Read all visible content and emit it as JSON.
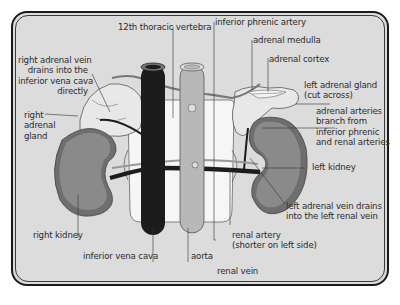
{
  "diagram": {
    "colors": {
      "background": "#dcdcdc",
      "frame": "#1a1a1a",
      "kidney": "#8a8a8a",
      "kidney_outer": "#6e6e6e",
      "inferior_vena_cava": "#1c1c1c",
      "aorta": "#b8b8b8",
      "adrenal_gland": "#e8e8e8",
      "vertebra": "#f6f6f6",
      "label_text": "#2b2b2b"
    },
    "labels": {
      "vertebra": "12th thoracic vertebra",
      "phrenic": "inferior phrenic artery",
      "medulla": "adrenal medulla",
      "cortex": "adrenal cortex",
      "left_gland_1": "left adrenal gland",
      "left_gland_2": "(cut across)",
      "arteries_1": "adrenal arteries",
      "arteries_2": "branch from",
      "arteries_3": "inferior phrenic",
      "arteries_4": "and renal arteries",
      "left_kidney": "left kidney",
      "left_vein_1": "left adrenal vein drains",
      "left_vein_2": "into the left renal vein",
      "renal_artery_1": "renal artery",
      "renal_artery_2": "(shorter on left side)",
      "renal_vein": "renal vein",
      "aorta": "aorta",
      "ivc": "inferior vena cava",
      "right_kidney": "right kidney",
      "right_gland_1": "right",
      "right_gland_2": "adrenal",
      "right_gland_3": "gland",
      "right_vein_1": "right adrenal vein",
      "right_vein_2": "drains into the",
      "right_vein_3": "inferior vena cava",
      "right_vein_4": "directly"
    }
  }
}
